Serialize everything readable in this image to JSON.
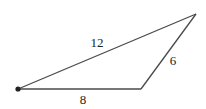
{
  "diagram": {
    "type": "triangle",
    "vertices": {
      "A": {
        "x": 18,
        "y": 89,
        "marked": true
      },
      "B": {
        "x": 141,
        "y": 89,
        "marked": false
      },
      "C": {
        "x": 196,
        "y": 14,
        "marked": false
      }
    },
    "sides": [
      {
        "from": "A",
        "to": "C",
        "label": "12",
        "label_x": 97,
        "label_y": 47
      },
      {
        "from": "B",
        "to": "C",
        "label": "6",
        "label_x": 173,
        "label_y": 65
      },
      {
        "from": "A",
        "to": "B",
        "label": "8",
        "label_x": 83,
        "label_y": 104
      }
    ],
    "colors": {
      "line": "#4a4a4a",
      "text": "#222222",
      "background": "#ffffff"
    }
  }
}
